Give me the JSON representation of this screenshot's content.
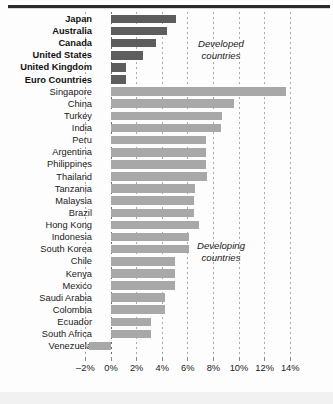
{
  "chart_data": {
    "type": "bar",
    "orientation": "horizontal",
    "title": "",
    "subtitle": "",
    "xlabel": "",
    "ylabel": "",
    "xlim": [
      -2,
      14
    ],
    "xticks": [
      -2,
      0,
      2,
      4,
      6,
      8,
      10,
      12,
      14
    ],
    "xticklabels": [
      "–2%",
      "0%",
      "2%",
      "4%",
      "6%",
      "8%",
      "10%",
      "12%",
      "14%"
    ],
    "grid": true,
    "legend_position": "none",
    "annotations": [
      {
        "id": "developed",
        "text": "Developed\ncountries"
      },
      {
        "id": "developing",
        "text": "Developing\ncountries"
      }
    ],
    "groups": [
      {
        "name": "Developed countries",
        "color": "#5d5d5d"
      },
      {
        "name": "Developing countries",
        "color": "#a8a8a8"
      }
    ],
    "categories": [
      "Japan",
      "Australia",
      "Canada",
      "United States",
      "United Kingdom",
      "Euro Countries",
      "Singapore",
      "China",
      "Turkey",
      "India",
      "Peru",
      "Argentina",
      "Philippines",
      "Thailand",
      "Tanzania",
      "Malaysia",
      "Brazil",
      "Hong Kong",
      "Indonesia",
      "South Korea",
      "Chile",
      "Kenya",
      "Mexico",
      "Saudi Arabia",
      "Colombia",
      "Ecuador",
      "South Africa",
      "Venezuela"
    ],
    "values": [
      5.1,
      4.4,
      3.5,
      2.5,
      1.2,
      1.2,
      13.7,
      9.6,
      8.7,
      8.6,
      7.4,
      7.4,
      7.4,
      7.5,
      6.6,
      6.5,
      6.5,
      6.9,
      6.1,
      6.1,
      5.0,
      5.0,
      5.0,
      4.2,
      4.2,
      3.1,
      3.1,
      -1.7
    ],
    "series": [
      {
        "name": "Developed countries",
        "color": "#5d5d5d",
        "points": [
          {
            "category": "Japan",
            "value": 5.1
          },
          {
            "category": "Australia",
            "value": 4.4
          },
          {
            "category": "Canada",
            "value": 3.5
          },
          {
            "category": "United States",
            "value": 2.5
          },
          {
            "category": "United Kingdom",
            "value": 1.2
          },
          {
            "category": "Euro Countries",
            "value": 1.2
          }
        ]
      },
      {
        "name": "Developing countries",
        "color": "#a8a8a8",
        "points": [
          {
            "category": "Singapore",
            "value": 13.7
          },
          {
            "category": "China",
            "value": 9.6
          },
          {
            "category": "Turkey",
            "value": 8.7
          },
          {
            "category": "India",
            "value": 8.6
          },
          {
            "category": "Peru",
            "value": 7.4
          },
          {
            "category": "Argentina",
            "value": 7.4
          },
          {
            "category": "Philippines",
            "value": 7.4
          },
          {
            "category": "Thailand",
            "value": 7.5
          },
          {
            "category": "Tanzania",
            "value": 6.6
          },
          {
            "category": "Malaysia",
            "value": 6.5
          },
          {
            "category": "Brazil",
            "value": 6.5
          },
          {
            "category": "Hong Kong",
            "value": 6.9
          },
          {
            "category": "Indonesia",
            "value": 6.1
          },
          {
            "category": "South Korea",
            "value": 6.1
          },
          {
            "category": "Chile",
            "value": 5.0
          },
          {
            "category": "Kenya",
            "value": 5.0
          },
          {
            "category": "Mexico",
            "value": 5.0
          },
          {
            "category": "Saudi Arabia",
            "value": 4.2
          },
          {
            "category": "Colombia",
            "value": 4.2
          },
          {
            "category": "Ecuador",
            "value": 3.1
          },
          {
            "category": "South Africa",
            "value": 3.1
          },
          {
            "category": "Venezuela",
            "value": -1.7
          }
        ]
      }
    ]
  },
  "annotations": {
    "developed": "Developed\ncountries",
    "developing": "Developing\ncountries"
  }
}
